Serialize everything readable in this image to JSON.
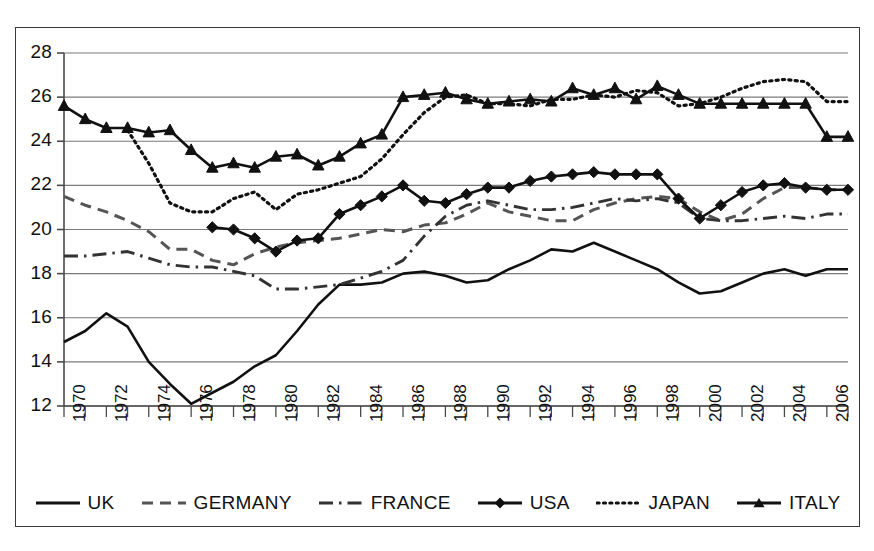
{
  "chart_data": {
    "type": "line",
    "title": "",
    "xlabel": "",
    "ylabel": "",
    "xlim": [
      1970,
      2007
    ],
    "ylim": [
      12,
      28
    ],
    "ytick_step": 2,
    "xtick_step": 1,
    "xtick_label_step": 2,
    "grid": true,
    "grid_axis": "y",
    "legend_position": "bottom",
    "x": [
      1970,
      1971,
      1972,
      1973,
      1974,
      1975,
      1976,
      1977,
      1978,
      1979,
      1980,
      1981,
      1982,
      1983,
      1984,
      1985,
      1986,
      1987,
      1988,
      1989,
      1990,
      1991,
      1992,
      1993,
      1994,
      1995,
      1996,
      1997,
      1998,
      1999,
      2000,
      2001,
      2002,
      2003,
      2004,
      2005,
      2006,
      2007
    ],
    "yticks": [
      12,
      14,
      16,
      18,
      20,
      22,
      24,
      26,
      28
    ],
    "xtick_labels": [
      "1970",
      "1972",
      "1974",
      "1976",
      "1978",
      "1980",
      "1982",
      "1984",
      "1986",
      "1988",
      "1990",
      "1992",
      "1994",
      "1996",
      "1998",
      "2000",
      "2002",
      "2004",
      "2006"
    ],
    "series": [
      {
        "name": "UK",
        "style": "solid",
        "marker": "none",
        "color": "#111111",
        "values": [
          14.9,
          15.4,
          16.2,
          15.6,
          14.0,
          13.0,
          12.1,
          12.6,
          13.1,
          13.8,
          14.3,
          15.4,
          16.6,
          17.5,
          17.5,
          17.6,
          18.0,
          18.1,
          17.9,
          17.6,
          17.7,
          18.2,
          18.6,
          19.1,
          19.0,
          19.4,
          19.0,
          18.6,
          18.2,
          17.6,
          17.1,
          17.2,
          17.6,
          18.0,
          18.2,
          17.9,
          18.2,
          18.2
        ]
      },
      {
        "name": "GERMANY",
        "style": "dashed",
        "marker": "none",
        "color": "#555555",
        "values": [
          21.5,
          21.1,
          20.8,
          20.4,
          19.9,
          19.1,
          19.1,
          18.6,
          18.4,
          18.9,
          19.2,
          19.4,
          19.5,
          19.6,
          19.8,
          20.0,
          19.9,
          20.2,
          20.3,
          20.7,
          21.2,
          20.8,
          20.6,
          20.4,
          20.4,
          20.9,
          21.2,
          21.4,
          21.5,
          21.4,
          20.8,
          20.4,
          20.7,
          21.4,
          21.9,
          21.9,
          21.8,
          21.8
        ]
      },
      {
        "name": "FRANCE",
        "style": "dashdot",
        "marker": "none",
        "color": "#333333",
        "values": [
          18.8,
          18.8,
          18.9,
          19.0,
          18.7,
          18.4,
          18.3,
          18.3,
          18.1,
          17.9,
          17.3,
          17.3,
          17.4,
          17.5,
          17.8,
          18.1,
          18.6,
          19.7,
          20.6,
          21.1,
          21.3,
          21.1,
          20.9,
          20.9,
          21.0,
          21.2,
          21.4,
          21.3,
          21.4,
          21.2,
          20.5,
          20.4,
          20.4,
          20.5,
          20.6,
          20.5,
          20.7,
          20.7
        ]
      },
      {
        "name": "USA",
        "style": "solid",
        "marker": "diamond",
        "color": "#111111",
        "values": [
          null,
          null,
          null,
          null,
          null,
          null,
          null,
          20.1,
          20.0,
          19.6,
          19.0,
          19.5,
          19.6,
          20.7,
          21.1,
          21.5,
          22.0,
          21.3,
          21.2,
          21.6,
          21.9,
          21.9,
          22.2,
          22.4,
          22.5,
          22.6,
          22.5,
          22.5,
          22.5,
          21.4,
          20.5,
          21.1,
          21.7,
          22.0,
          22.1,
          21.9,
          21.8,
          21.8
        ]
      },
      {
        "name": "JAPAN",
        "style": "dotted",
        "marker": "none",
        "color": "#111111",
        "values": [
          null,
          null,
          null,
          24.5,
          23.0,
          21.2,
          20.8,
          20.8,
          21.4,
          21.7,
          20.9,
          21.6,
          21.8,
          22.1,
          22.4,
          23.2,
          24.3,
          25.3,
          26.0,
          26.1,
          25.7,
          25.7,
          25.6,
          25.9,
          25.9,
          26.1,
          26.0,
          26.3,
          26.2,
          25.6,
          25.7,
          26.0,
          26.4,
          26.7,
          26.8,
          26.7,
          25.8,
          25.8
        ]
      },
      {
        "name": "ITALY",
        "style": "solid",
        "marker": "triangle",
        "color": "#111111",
        "values": [
          25.6,
          25.0,
          24.6,
          24.6,
          24.4,
          24.5,
          23.6,
          22.8,
          23.0,
          22.8,
          23.3,
          23.4,
          22.9,
          23.3,
          23.9,
          24.3,
          26.0,
          26.1,
          26.2,
          25.9,
          25.7,
          25.8,
          25.9,
          25.8,
          26.4,
          26.1,
          26.4,
          25.9,
          26.5,
          26.1,
          25.7,
          25.7,
          25.7,
          25.7,
          25.7,
          25.7,
          24.2,
          24.2
        ]
      }
    ]
  },
  "legend": {
    "items": [
      {
        "label": "UK",
        "key": "line-solid"
      },
      {
        "label": "GERMANY",
        "key": "line-dashed"
      },
      {
        "label": "FRANCE",
        "key": "line-dashdot"
      },
      {
        "label": "USA",
        "key": "line-solid-diamond"
      },
      {
        "label": "JAPAN",
        "key": "line-dotted"
      },
      {
        "label": "ITALY",
        "key": "line-solid-triangle"
      }
    ]
  },
  "colors": {
    "frame": "#3a3a3a",
    "grid": "#7a7a7a",
    "axis": "#4a4a4a",
    "ink": "#111111",
    "ink_light": "#555555",
    "background": "#ffffff"
  }
}
